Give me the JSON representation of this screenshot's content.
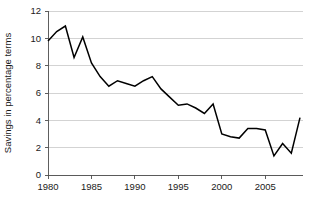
{
  "figure": {
    "background_color": "#ffffff",
    "line_color": "#000000",
    "grid_color": "#c8c8c8",
    "axis_color": "#4d4d4d",
    "text_color": "#1a1a1a"
  },
  "chart_data": {
    "type": "line",
    "title": "",
    "subtitle": "",
    "xlabel": "",
    "ylabel": "Savings in percentage terms",
    "xlim": [
      1980,
      2009
    ],
    "ylim": [
      0,
      12
    ],
    "ytick_labels": [
      "0",
      "2",
      "4",
      "6",
      "8",
      "10",
      "12"
    ],
    "ytick_values": [
      0,
      2,
      4,
      6,
      8,
      10,
      12
    ],
    "xtick_labels": [
      "1980",
      "1985",
      "1990",
      "1995",
      "2000",
      "2005"
    ],
    "xtick_values": [
      1980,
      1985,
      1990,
      1995,
      2000,
      2005
    ],
    "grid": "horizontal",
    "legend": "none",
    "annotations": [],
    "x": [
      1980,
      1981,
      1982,
      1983,
      1984,
      1985,
      1986,
      1987,
      1988,
      1989,
      1990,
      1991,
      1992,
      1993,
      1994,
      1995,
      1996,
      1997,
      1998,
      1999,
      2000,
      2001,
      2002,
      2003,
      2004,
      2005,
      2006,
      2007,
      2008,
      2009
    ],
    "values": [
      9.8,
      10.5,
      10.9,
      8.6,
      10.1,
      8.2,
      7.2,
      6.5,
      6.9,
      6.7,
      6.5,
      6.9,
      7.2,
      6.3,
      5.7,
      5.1,
      5.2,
      4.9,
      4.5,
      5.2,
      3.0,
      2.8,
      2.7,
      3.4,
      3.4,
      3.3,
      1.4,
      2.3,
      1.6,
      4.2
    ],
    "series": [
      {
        "name": "Savings in percentage terms",
        "values": [
          9.8,
          10.5,
          10.9,
          8.6,
          10.1,
          8.2,
          7.2,
          6.5,
          6.9,
          6.7,
          6.5,
          6.9,
          7.2,
          6.3,
          5.7,
          5.1,
          5.2,
          4.9,
          4.5,
          5.2,
          3.0,
          2.8,
          2.7,
          3.4,
          3.4,
          3.3,
          1.4,
          2.3,
          1.6,
          4.2
        ]
      }
    ]
  },
  "geometry": {
    "plot_left": 48,
    "plot_right": 300,
    "plot_top": 11,
    "plot_bottom": 175,
    "grid_right": 303
  }
}
